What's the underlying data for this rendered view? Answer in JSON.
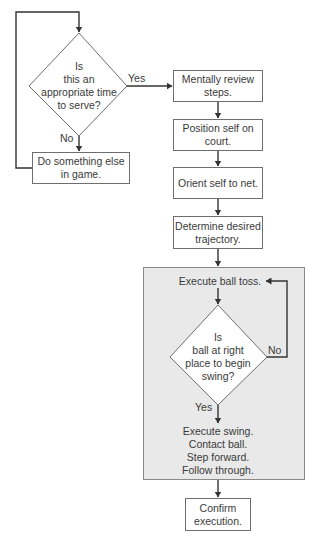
{
  "decision1": {
    "text": "Is\nthis an\nappropriate time\nto serve?",
    "yes_label": "Yes",
    "no_label": "No"
  },
  "no_branch_box": {
    "text": "Do something else in game."
  },
  "steps": [
    {
      "text": "Mentally review steps."
    },
    {
      "text": "Position self on court."
    },
    {
      "text": "Orient self to net."
    },
    {
      "text": "Determine desired trajectory."
    }
  ],
  "toss_loop": {
    "toss_text": "Execute ball toss.",
    "decision2": {
      "text": "Is\nball at right\nplace to begin\nswing?",
      "yes_label": "Yes",
      "no_label": "No"
    },
    "swing_text": "Execute swing.\nContact ball.\nStep forward.\nFollow through."
  },
  "final_box": {
    "text": "Confirm execution."
  },
  "colors": {
    "panel_fill": "#e9e9e9",
    "line": "#333333"
  }
}
